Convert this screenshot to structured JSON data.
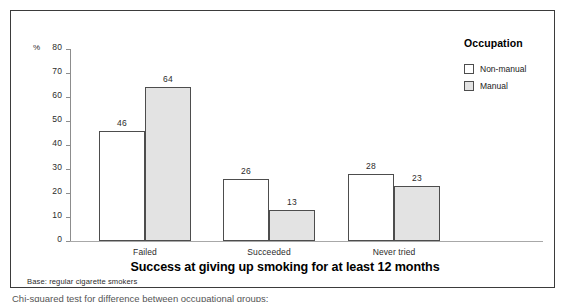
{
  "chart_data": {
    "type": "bar",
    "title": "Success at giving up smoking for at least 12 months",
    "subtitle": "",
    "xlabel": "",
    "ylabel": "%",
    "categories": [
      "Failed",
      "Succeeded",
      "Never tried"
    ],
    "series": [
      {
        "name": "Non-manual",
        "values": [
          46,
          26,
          28
        ],
        "color": "#ffffff"
      },
      {
        "name": "Manual",
        "values": [
          64,
          13,
          23
        ],
        "color": "#e3e3e3"
      }
    ],
    "ylim": [
      0,
      80
    ],
    "ytick_step": 10,
    "yticks": [
      0,
      10,
      20,
      30,
      40,
      50,
      60,
      70,
      80
    ],
    "grid": false,
    "legend_title": "Occupation",
    "legend_position": "top-right",
    "annotations": [
      "Base: regular cigarette smokers"
    ],
    "data_labels": true
  },
  "axis": {
    "percent_symbol": "%",
    "ticks": [
      "80",
      "70",
      "60",
      "50",
      "40",
      "30",
      "20",
      "10",
      "0"
    ]
  },
  "legend": {
    "title": "Occupation",
    "items": [
      {
        "label": "Non-manual"
      },
      {
        "label": "Manual"
      }
    ]
  },
  "labels": {
    "categories": [
      "Failed",
      "Succeeded",
      "Never tried"
    ],
    "values": {
      "failed": [
        "46",
        "64"
      ],
      "succeeded": [
        "26",
        "13"
      ],
      "never_tried": [
        "28",
        "23"
      ]
    }
  },
  "footer": {
    "title": "Success at giving up smoking for at least 12 months",
    "base_note": "Base: regular cigarette smokers",
    "caption_clipped": "Chi-squared test for difference between occupational groups:"
  },
  "colors": {
    "series_non_manual": "#ffffff",
    "series_manual": "#e3e3e3",
    "bar_outline": "#4d4d4d",
    "frame": "#3b3b3b",
    "axis": "#8d8d8d"
  }
}
